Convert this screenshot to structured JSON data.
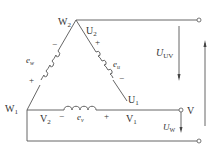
{
  "diagram": {
    "nodes": {
      "W2": {
        "main": "W",
        "sub": "2"
      },
      "U2": {
        "main": "U",
        "sub": "2"
      },
      "U1": {
        "main": "U",
        "sub": "1"
      },
      "W1": {
        "main": "W",
        "sub": "1"
      },
      "V2": {
        "main": "V",
        "sub": "2"
      },
      "V1": {
        "main": "V",
        "sub": "1"
      },
      "V_terminal": "V"
    },
    "emfs": {
      "ew": {
        "main": "e",
        "sub": "w"
      },
      "eu": {
        "main": "e",
        "sub": "u"
      },
      "ev": {
        "main": "e",
        "sub": "v"
      }
    },
    "polarity": {
      "left_top": "−",
      "left_bottom": "+",
      "right_top": "+",
      "right_bottom": "−",
      "bottom_left": "−",
      "bottom_right": "+"
    },
    "voltages": {
      "UV": {
        "main": "U",
        "sub": "UV"
      },
      "W": {
        "main": "U",
        "sub": "W"
      }
    }
  }
}
